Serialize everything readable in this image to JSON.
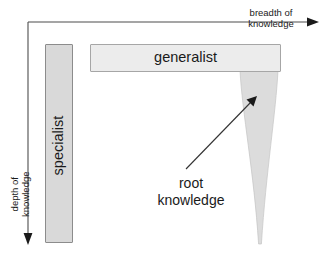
{
  "diagram": {
    "background_color": "#ffffff",
    "axes": {
      "horizontal": {
        "name": "breadth-axis",
        "label": "breadth of\nknowledge",
        "direction": "right",
        "color": "#4d4d4d"
      },
      "vertical": {
        "name": "depth-axis",
        "label": "depth of\nknowledge",
        "direction": "down",
        "color": "#4d4d4d"
      }
    },
    "shapes": {
      "specialist_bar": {
        "label": "specialist",
        "orientation": "vertical",
        "fill": "#d9d9d9",
        "border": "#8c8c8c"
      },
      "generalist_bar": {
        "label": "generalist",
        "orientation": "horizontal",
        "fill": "#e8e8e8",
        "border": "#a6a6a6"
      },
      "root_spike": {
        "label": "root knowledge",
        "fill": "#dcdcdc",
        "border": "#bfbfbf"
      }
    },
    "annotation": {
      "label": "root\nknowledge",
      "arrow_color": "#333333"
    }
  }
}
